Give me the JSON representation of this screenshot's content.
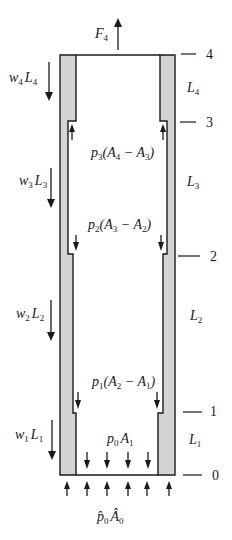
{
  "diagram": {
    "colors": {
      "wall_fill": "#d4d4d4",
      "stroke": "#1a1a1a",
      "background": "#ffffff"
    },
    "top_force": {
      "symbol": "F",
      "subscript": "4"
    },
    "levels": [
      {
        "label": "4",
        "y": 55
      },
      {
        "label": "3",
        "y": 121
      },
      {
        "label": "2",
        "y": 254
      },
      {
        "label": "1",
        "y": 413
      },
      {
        "label": "0",
        "y": 475
      }
    ],
    "segment_lengths": [
      {
        "symbol": "L",
        "subscript": "4"
      },
      {
        "symbol": "L",
        "subscript": "3"
      },
      {
        "symbol": "L",
        "subscript": "2"
      },
      {
        "symbol": "L",
        "subscript": "1"
      }
    ],
    "weights": [
      {
        "w": "w",
        "w_sub": "4",
        "L": "L",
        "L_sub": "4"
      },
      {
        "w": "w",
        "w_sub": "3",
        "L": "L",
        "L_sub": "3"
      },
      {
        "w": "w",
        "w_sub": "2",
        "L": "L",
        "L_sub": "2"
      },
      {
        "w": "w",
        "w_sub": "1",
        "L": "L",
        "L_sub": "1"
      }
    ],
    "pressure_labels": {
      "p3": {
        "p": "p",
        "p_sub": "3",
        "open": "(A",
        "a_sub": "4",
        "minus": " − A",
        "b_sub": "3",
        "close": ")"
      },
      "p2": {
        "p": "p",
        "p_sub": "2",
        "open": "(A",
        "a_sub": "3",
        "minus": " − A",
        "b_sub": "2",
        "close": ")"
      },
      "p1": {
        "p": "p",
        "p_sub": "1",
        "open": "(A",
        "a_sub": "2",
        "minus": " − A",
        "b_sub": "1",
        "close": ")"
      },
      "p0": {
        "p": "p",
        "p_sub": "0",
        "A": "A",
        "A_sub": "1"
      },
      "p0hat": {
        "p": "p̂",
        "p_sub": "0",
        "A": "Â",
        "A_sub": "0"
      }
    }
  }
}
